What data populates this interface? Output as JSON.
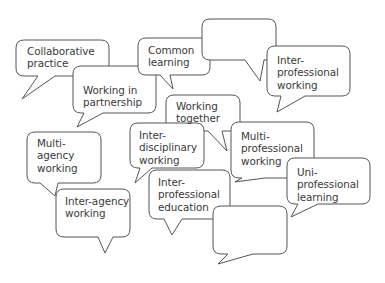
{
  "diagram": {
    "type": "speech-bubble word cloud",
    "stroke_color": "#555555",
    "fill_color": "#ffffff",
    "text_color": "#3a3a3a",
    "bubbles": [
      {
        "id": "collaborative-practice",
        "label": "Collaborative\npractice",
        "box": [
          16,
          40,
          109,
          76
        ],
        "tail": [
          [
            38,
            76
          ],
          [
            22,
            99
          ],
          [
            55,
            76
          ]
        ],
        "text_pos": [
          27,
          45
        ]
      },
      {
        "id": "working-in-partnership",
        "label": "Working in\npartnership",
        "box": [
          73,
          66,
          156,
          113
        ],
        "tail": [
          [
            84,
            113
          ],
          [
            77,
            127
          ],
          [
            103,
            113
          ]
        ],
        "text_pos": [
          83,
          84
        ]
      },
      {
        "id": "common-learning",
        "label": "Common\nlearning",
        "box": [
          138,
          38,
          210,
          75
        ],
        "tail": [
          [
            160,
            75
          ],
          [
            173,
            89
          ],
          [
            170,
            75
          ]
        ],
        "text_pos": [
          148,
          44
        ]
      },
      {
        "id": "empty-top",
        "label": "",
        "box": [
          202,
          19,
          276,
          60
        ],
        "tail": [
          [
            245,
            60
          ],
          [
            260,
            81
          ],
          [
            264,
            60
          ]
        ],
        "text_pos": [
          0,
          0
        ]
      },
      {
        "id": "inter-professional-working",
        "label": "Inter-\nprofessional\nworking",
        "box": [
          267,
          46,
          350,
          96
        ],
        "tail": [
          [
            281,
            96
          ],
          [
            277,
            112
          ],
          [
            305,
            96
          ]
        ],
        "text_pos": [
          277,
          54
        ]
      },
      {
        "id": "working-together",
        "label": "Working\ntogether",
        "box": [
          166,
          95,
          240,
          131
        ],
        "tail": [
          [
            208,
            131
          ],
          [
            227,
            151
          ],
          [
            222,
            131
          ]
        ],
        "text_pos": [
          176,
          100
        ]
      },
      {
        "id": "inter-disciplinary-working",
        "label": "Inter-\ndisciplinary\nworking",
        "box": [
          130,
          123,
          204,
          168
        ],
        "tail": [
          [
            140,
            168
          ],
          [
            135,
            183
          ],
          [
            152,
            168
          ]
        ],
        "text_pos": [
          139,
          129
        ]
      },
      {
        "id": "multi-professional-working",
        "label": "Multi-\nprofessional\nworking",
        "box": [
          231,
          122,
          314,
          178
        ],
        "tail": [
          [
            242,
            178
          ],
          [
            235,
            182
          ],
          [
            265,
            178
          ]
        ],
        "text_pos": [
          241,
          130
        ]
      },
      {
        "id": "multi-agency-working",
        "label": "Multi-\nagency\nworking",
        "box": [
          27,
          132,
          101,
          183
        ],
        "tail": [
          [
            40,
            183
          ],
          [
            55,
            196
          ],
          [
            58,
            183
          ]
        ],
        "text_pos": [
          37,
          137
        ]
      },
      {
        "id": "inter-agency-working",
        "label": "Inter-agency\nworking",
        "box": [
          56,
          189,
          130,
          237
        ],
        "tail": [
          [
            98,
            237
          ],
          [
            105,
            253
          ],
          [
            113,
            237
          ]
        ],
        "text_pos": [
          65,
          195
        ]
      },
      {
        "id": "inter-professional-education",
        "label": "Inter-\nprofessional\neducation",
        "box": [
          149,
          170,
          230,
          219
        ],
        "tail": [
          [
            164,
            219
          ],
          [
            172,
            235
          ],
          [
            182,
            219
          ]
        ],
        "text_pos": [
          158,
          176
        ]
      },
      {
        "id": "uni-professional-learning",
        "label": "Uni-\nprofessional\nlearning",
        "box": [
          287,
          158,
          370,
          204
        ],
        "tail": [
          [
            298,
            204
          ],
          [
            291,
            217
          ],
          [
            318,
            204
          ]
        ],
        "text_pos": [
          297,
          166
        ]
      },
      {
        "id": "empty-bottom",
        "label": "",
        "box": [
          213,
          206,
          287,
          254
        ],
        "tail": [
          [
            228,
            254
          ],
          [
            218,
            264
          ],
          [
            253,
            254
          ]
        ],
        "text_pos": [
          0,
          0
        ]
      }
    ]
  }
}
